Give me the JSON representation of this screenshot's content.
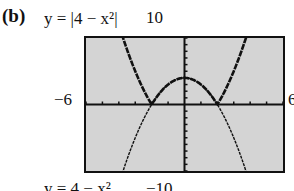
{
  "figure": {
    "part_label": "(b)",
    "top_equation": "y = |4 − x²|",
    "bottom_equation": "y = 4 − x²",
    "window": {
      "xmin_label": "−6",
      "xmax_label": "6",
      "ymax_label": "10",
      "ymin_label": "−10"
    }
  },
  "chart_data": {
    "type": "line",
    "title": "",
    "xlabel": "",
    "ylabel": "",
    "xlim": [
      -6,
      6
    ],
    "ylim": [
      -10,
      10
    ],
    "grid": false,
    "x_tick_step": 1,
    "y_tick_step": 1,
    "series": [
      {
        "name": "y = |4 − x²|",
        "style": "thick/dark",
        "x": [
          -6,
          -5,
          -4,
          -3,
          -2,
          -1,
          0,
          1,
          2,
          3,
          4,
          5,
          6
        ],
        "y": [
          32,
          21,
          12,
          5,
          0,
          3,
          4,
          3,
          0,
          5,
          12,
          21,
          32
        ]
      },
      {
        "name": "y = 4 − x²",
        "style": "thin",
        "x": [
          -6,
          -5,
          -4,
          -3,
          -2,
          -1,
          0,
          1,
          2,
          3,
          4,
          5,
          6
        ],
        "y": [
          -32,
          -21,
          -12,
          -5,
          0,
          3,
          4,
          3,
          0,
          -5,
          -12,
          -21,
          -32
        ]
      }
    ],
    "annotations": [
      "(b)",
      "y = |4 − x²|",
      "y = 4 − x²",
      "10",
      "−10",
      "−6",
      "6"
    ]
  },
  "colors": {
    "screen_bg": "#d4d4d4",
    "ink": "#111111"
  }
}
